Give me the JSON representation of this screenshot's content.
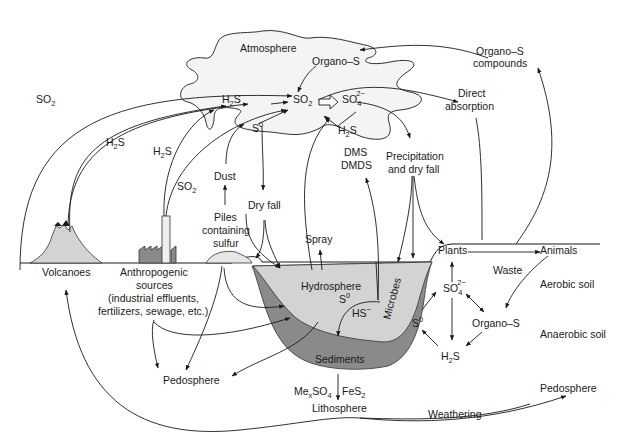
{
  "diagram": {
    "colors": {
      "line": "#1a1a1a",
      "atmosphere_fill": "#f4f4f4",
      "hydrosphere_fill": "#d3d3d3",
      "sediments_fill": "#8a8a8a",
      "volcano_fill": "#d3d3d3",
      "factory_fill": "#8a8a8a"
    },
    "atmosphere": {
      "label": "Atmosphere",
      "organo_s": "Organo–S",
      "h2s": "H",
      "h2s_sub": "2",
      "h2s_tail": "S",
      "so2": "SO",
      "so2_sub": "2",
      "so4": "SO",
      "so4_sub": "4",
      "so4_sup": "2−",
      "s0": "S",
      "s0_sup": "0",
      "h2s_lower": "H",
      "h2s_lower_sub": "2",
      "h2s_lower_tail": "S",
      "dms": "DMS",
      "dmds": "DMDS"
    },
    "flows_left": {
      "so2_volcano": "SO",
      "so2_volcano_sub": "2",
      "h2s_volcano": "H",
      "h2s_volcano_sub": "2",
      "h2s_volcano_tail": "S",
      "h2s_factory": "H",
      "h2s_factory_sub": "2",
      "h2s_factory_tail": "S",
      "so2_factory": "SO",
      "so2_factory_sub": "2",
      "dust": "Dust",
      "piles": [
        "Piles",
        "containing",
        "sulfur"
      ],
      "dry_fall": "Dry fall",
      "spray": "Spray"
    },
    "flows_right": {
      "organo_s_compounds": [
        "Organo–S",
        "compounds"
      ],
      "direct_absorption": [
        "Direct",
        "absorption"
      ],
      "precipitation": [
        "Precipitation",
        "and dry fall"
      ]
    },
    "surface": {
      "volcanoes": "Volcanoes",
      "anthropogenic": [
        "Anthropogenic",
        "sources",
        "(industrial effluents,",
        "fertilizers, sewage, etc.)"
      ],
      "pedosphere_left": "Pedosphere",
      "hydrosphere": "Hydrosphere",
      "hs0": "S",
      "hs0_sup": "0",
      "hs_minus": "HS",
      "hs_minus_sup": "−",
      "microbes": "Microbes",
      "sediments": "Sediments",
      "mexso4_a": "Me",
      "mexso4_sub_x": "x",
      "mexso4_b": "SO",
      "mexso4_sub_4": "4",
      "fes2": "FeS",
      "fes2_sub": "2",
      "lithosphere": "Lithosphere",
      "weathering": "Weathering",
      "pedosphere_right": "Pedosphere"
    },
    "soil": {
      "plants": "Plants",
      "animals": "Animals",
      "waste": "Waste",
      "aerobic_soil": "Aerobic soil",
      "anaerobic_soil": "Anaerobic soil",
      "so4": "SO",
      "so4_sub": "4",
      "so4_sup": "2−",
      "s0": "S",
      "s0_sup": "0",
      "organo_s": "Organo–S",
      "h2s": "H",
      "h2s_sub": "2",
      "h2s_tail": "S"
    }
  }
}
